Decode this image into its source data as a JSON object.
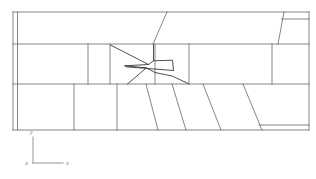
{
  "figure": {
    "background_color": "#ffffff",
    "mesh_line_color": "#6f6f6f",
    "body_line_color": "#3d3d3d",
    "axis_color": "#8a8a8a"
  },
  "axes_triad": {
    "name": "coordinate-triad",
    "origin_label": "z",
    "vertical_label": "y",
    "horizontal_label": "x",
    "labels": [
      "y",
      "x",
      "z"
    ]
  },
  "domain_outline": {
    "left": 13,
    "right": 309,
    "top": 12,
    "bottom": 130,
    "description": "outer rectangular computational domain"
  },
  "bands": [
    {
      "name": "upper-band",
      "y_top": 12,
      "y_bottom": 44
    },
    {
      "name": "middle-band",
      "y_top": 44,
      "y_bottom": 84
    },
    {
      "name": "lower-band",
      "y_top": 84,
      "y_bottom": 130
    }
  ],
  "block_counts": {
    "upper_band_blocks": 4,
    "middle_band_blocks": 6,
    "lower_band_blocks": 7,
    "total_visible_blocks": 17
  },
  "body_shape": {
    "name": "aircraft-section",
    "description": "wing and fuselage silhouette with leading-edge spike"
  }
}
